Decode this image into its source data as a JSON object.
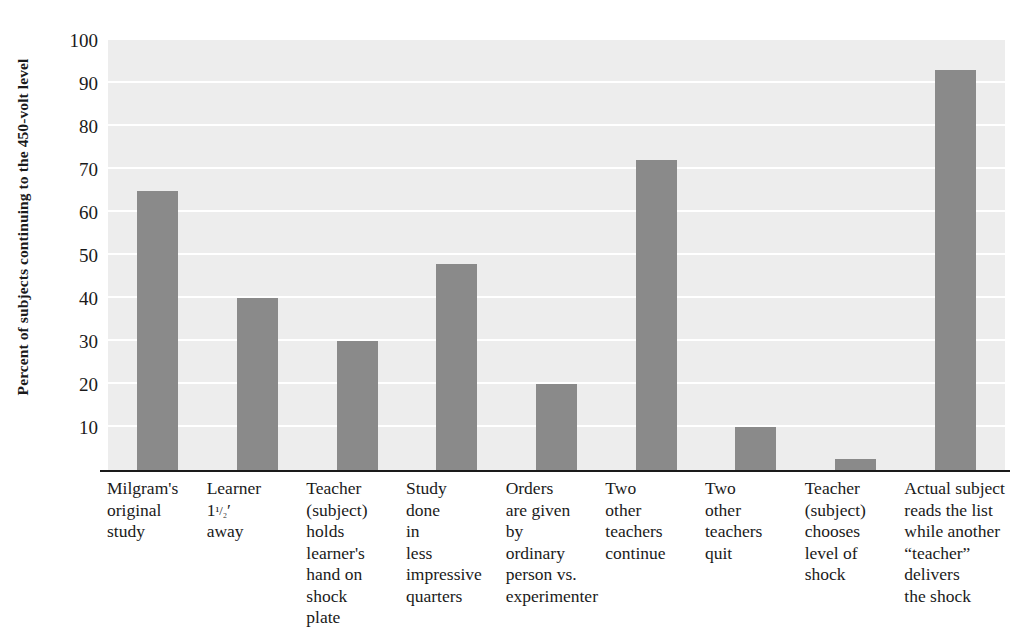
{
  "chart_data": {
    "type": "bar",
    "title": "",
    "subtitle": "",
    "xlabel": "",
    "ylabel": "Percent of subjects continuing to the 450-volt level",
    "ylim": [
      0,
      100
    ],
    "ytick_values": [
      10,
      20,
      30,
      40,
      50,
      60,
      70,
      80,
      90,
      100
    ],
    "ytick_labels": [
      "10",
      "20",
      "30",
      "40",
      "50",
      "60",
      "70",
      "80",
      "90",
      "100"
    ],
    "grid": true,
    "legend": "none",
    "bar_color": "#8a8a8a",
    "plot_background_color": "#ededed",
    "gridline_color": "#ffffff",
    "axis_color": "#1a1a1a",
    "categories": [
      "Milgram's\noriginal\nstudy",
      "Learner\n1 1/2'\naway",
      "Teacher\n(subject)\nholds\nlearner's\nhand on\nshock\nplate",
      "Study\ndone\nin\nless\nimpressive\nquarters",
      "Orders\nare given\nby\nordinary\nperson vs.\nexperimenter",
      "Two\nother\nteachers\ncontinue",
      "Two\nother\nteachers\nquit",
      "Teacher\n(subject)\nchooses\nlevel of\nshock",
      "Actual subject\nreads the list\nwhile another\n“teacher”\ndelivers\nthe shock"
    ],
    "category_lines": [
      [
        "Milgram's",
        "original",
        "study"
      ],
      [
        "Learner",
        "1 1/2'",
        "away"
      ],
      [
        "Teacher",
        "(subject)",
        "holds",
        "learner's",
        "hand on",
        "shock",
        "plate"
      ],
      [
        "Study",
        "done",
        "in",
        "less",
        "impressive",
        "quarters"
      ],
      [
        "Orders",
        "are given",
        "by",
        "ordinary",
        "person vs.",
        "experimenter"
      ],
      [
        "Two",
        "other",
        "teachers",
        "continue"
      ],
      [
        "Two",
        "other",
        "teachers",
        "quit"
      ],
      [
        "Teacher",
        "(subject)",
        "chooses",
        "level of",
        "shock"
      ],
      [
        "Actual subject",
        "reads the list",
        "while another",
        "“teacher”",
        "delivers",
        "the shock"
      ]
    ],
    "values": [
      65,
      40,
      30,
      48,
      20,
      72,
      10,
      2.5,
      93
    ]
  }
}
